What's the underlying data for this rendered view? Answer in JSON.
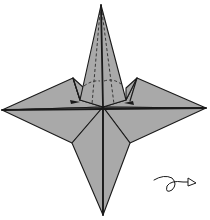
{
  "diagram": {
    "colors": {
      "paper": "#a9a9a9",
      "paper_shade": "#9e9e9e",
      "ink": "#1a1a1a",
      "background": "#ffffff"
    },
    "symbols": [
      {
        "name": "valley-fold-dashed-lines",
        "location": "top-point"
      },
      {
        "name": "fold-arc-arrows",
        "location": "top-point-base"
      },
      {
        "name": "turn-over-arrow",
        "location": "bottom-right"
      }
    ]
  }
}
